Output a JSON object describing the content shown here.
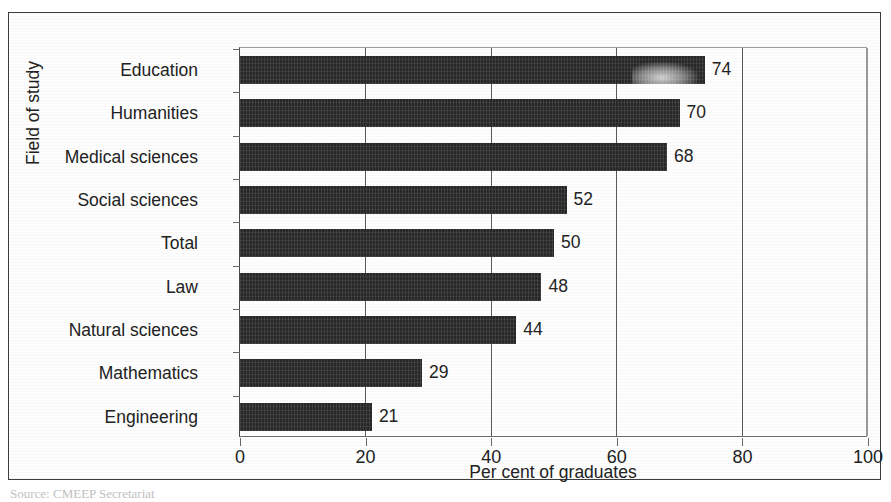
{
  "chart_data": {
    "type": "bar",
    "orientation": "horizontal",
    "title": "",
    "xlabel": "Per cent of graduates",
    "ylabel": "Field of study",
    "categories": [
      "Education",
      "Humanities",
      "Medical sciences",
      "Social sciences",
      "Total",
      "Law",
      "Natural sciences",
      "Mathematics",
      "Engineering"
    ],
    "values": [
      74,
      70,
      68,
      52,
      50,
      48,
      44,
      29,
      21
    ],
    "value_labels": [
      "74",
      "70",
      "68",
      "52",
      "50",
      "48",
      "44",
      "29",
      "21"
    ],
    "xlim": [
      0,
      100
    ],
    "xticks": [
      0,
      20,
      40,
      60,
      80,
      100
    ],
    "xtick_labels": [
      "0",
      "20",
      "40",
      "60",
      "80",
      "100"
    ],
    "grid": "vertical",
    "legend": "none",
    "bar_color": "#272727",
    "axis_color": "#4a4a4a",
    "gridline_color": "#5a5a5a"
  },
  "source": {
    "note": "Source: CMEEP Secretariat"
  }
}
